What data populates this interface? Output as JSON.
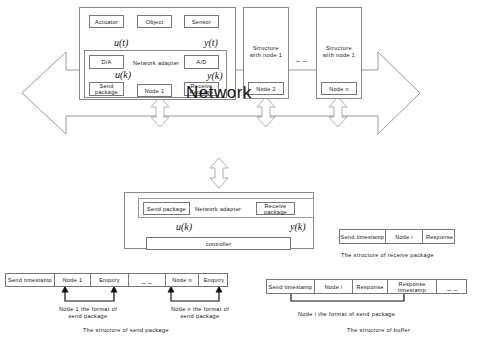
{
  "top_node": {
    "actuator": "Actuator",
    "object": "Object",
    "sensor": "Sensor",
    "da": "D/A",
    "ad": "A/D",
    "adapter_label": "Network adapter",
    "send_package": "Send package",
    "receive_package": "Receive Package",
    "node_label": "Node 1",
    "u_t": "u(t)",
    "y_t": "y(t)",
    "u_k": "u(k)",
    "y_k": "y(k)"
  },
  "other_nodes": [
    {
      "structure": "Structure with node 1",
      "node_label": "Node 2"
    },
    {
      "structure": "Structure with node 1",
      "node_label": "Node n"
    }
  ],
  "ellipsis": "_ _",
  "network_label": "Network",
  "controller_node": {
    "send_package": "Send package",
    "receive_package": "Receive package",
    "adapter_label": "Network adapter",
    "controller": "controller",
    "u_k": "u(k)",
    "y_k": "y(k)"
  },
  "receive_structure": {
    "cells": [
      "Send timestamp",
      "Node i",
      "Response"
    ],
    "caption": "The structure of receive package"
  },
  "send_structure": {
    "cells": [
      "Send timestamp",
      "Node 1",
      "Enquiry",
      "_ _",
      "Node n",
      "Enquiry"
    ],
    "annotations": [
      "Node 1 the format of send package",
      "Node n the format of send package"
    ],
    "caption": "The structure of send package"
  },
  "buffer_structure": {
    "cells": [
      "Send timestamp",
      "Node i",
      "Response",
      "Response timestamp",
      "_ _"
    ],
    "annotation": "Node i the format of send package",
    "caption": "The structure of buffer"
  }
}
